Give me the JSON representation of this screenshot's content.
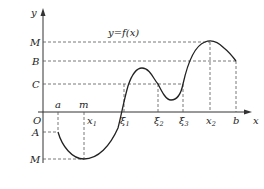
{
  "diagram": {
    "title": "y=f(x)",
    "axes": {
      "y_label": "y",
      "x_label": "x",
      "origin_label": "O"
    },
    "y_levels": [
      {
        "name": "M",
        "role": "maximum",
        "y": 42
      },
      {
        "name": "B",
        "role": "f(b)",
        "y": 61
      },
      {
        "name": "C",
        "role": "level",
        "y": 84
      },
      {
        "name": "A",
        "role": "f(a)",
        "y": 132
      },
      {
        "name": "M",
        "role": "minimum",
        "y": 159
      }
    ],
    "x_marks": {
      "above_axis": [
        {
          "label": "a",
          "x": 58
        },
        {
          "label": "m",
          "x": 84
        }
      ],
      "below_axis": [
        {
          "label": "x",
          "sub": "1",
          "x": 84
        },
        {
          "label": "ξ",
          "sub": "1",
          "x": 124
        },
        {
          "label": "ξ",
          "sub": "2",
          "x": 158
        },
        {
          "label": "ξ",
          "sub": "3",
          "x": 183
        },
        {
          "label": "x",
          "sub": "2",
          "x": 210
        },
        {
          "label": "b",
          "x": 236
        }
      ]
    },
    "colors": {
      "curve": "#222222",
      "axis": "#333333",
      "dash": "#555555",
      "background": "#ffffff"
    }
  }
}
